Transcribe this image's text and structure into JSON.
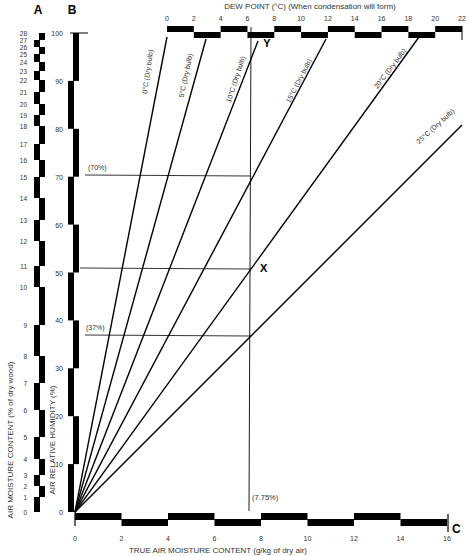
{
  "chart_data": {
    "type": "line",
    "xlabel": "TRUE AIR MOISTURE CONTENT (g/kg of dry air)",
    "ylabel": "AIR RELATIVE HUMIDITY (%)",
    "ylabel_a": "AIR MOISTURE CONTENT (% of dry wood)",
    "top_axis_label": "DEW POINT (°C) (When condensation will form)",
    "axis_letters": {
      "a": "A",
      "b": "B",
      "c": "C",
      "x": "X",
      "y": "Y"
    },
    "x_ticks": [
      "0",
      "2",
      "4",
      "6",
      "8",
      "10",
      "12",
      "14",
      "16"
    ],
    "xlim": [
      0,
      16
    ],
    "b_ticks": [
      "0",
      "10",
      "20",
      "30",
      "40",
      "50",
      "60",
      "70",
      "80",
      "90",
      "100"
    ],
    "ylim": [
      0,
      100
    ],
    "a_ticks": [
      "0",
      "1",
      "2",
      "3",
      "4",
      "5",
      "6",
      "7",
      "8",
      "9",
      "10",
      "11",
      "12",
      "13",
      "14",
      "15",
      "16",
      "17",
      "18",
      "19",
      "20",
      "21",
      "22",
      "23",
      "24",
      "25",
      "26",
      "27",
      "28"
    ],
    "dew_ticks": [
      "0",
      "2",
      "4",
      "6",
      "8",
      "10",
      "12",
      "14",
      "16",
      "18",
      "20",
      "22"
    ],
    "series": [
      {
        "name": "0°C (Dry bulb)",
        "label": "0°C (Dry bulb)",
        "x": [
          0,
          3.97
        ],
        "y": [
          0,
          100
        ]
      },
      {
        "name": "5°C (Dry bulb)",
        "label": "5°C (Dry bulb)",
        "x": [
          0,
          5.65
        ],
        "y": [
          0,
          100
        ]
      },
      {
        "name": "10°C (Dry bulb)",
        "label": "10°C (Dry bulb)",
        "x": [
          0,
          7.87
        ],
        "y": [
          0,
          100
        ]
      },
      {
        "name": "15°C (Dry bulb)",
        "label": "15°C (Dry bulb)",
        "x": [
          0,
          10.8
        ],
        "y": [
          0,
          100
        ]
      },
      {
        "name": "20°C (Dry bulb)",
        "label": "20°C (Dry bulb)",
        "x": [
          0,
          14.8
        ],
        "y": [
          0,
          100
        ]
      },
      {
        "name": "25°C (Dry bulb)",
        "label": "25°C (Dry bulb)",
        "x": [
          0,
          16.6
        ],
        "y": [
          0,
          80
        ]
      }
    ],
    "annotations": [
      {
        "label": "(70%)",
        "y": 70
      },
      {
        "label": "(37%)",
        "y": 37
      },
      {
        "label": "(7.75%)",
        "x": 7.75
      },
      {
        "label": "X",
        "x": 7.75,
        "y": 51
      },
      {
        "label": "Y",
        "dew_point": 10
      }
    ],
    "reference_lines": {
      "horizontal_rh": [
        70,
        51,
        37
      ],
      "vertical_x": 7.75
    },
    "grid": false,
    "legend": "none"
  }
}
